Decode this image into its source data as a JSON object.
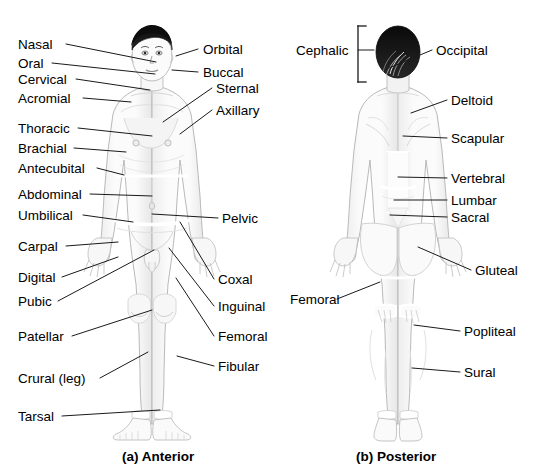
{
  "figure": {
    "type": "anatomical-regions-diagram",
    "background_color": "#ffffff",
    "text_color": "#000000",
    "leader_line_color": "#1a1a1a",
    "body_fill_color": "#fafafa",
    "body_outline_color": "#b8b8b8",
    "hair_color": "#101010"
  },
  "panels": [
    {
      "id": "anterior",
      "caption": "(a) Anterior",
      "caption_x": 122,
      "caption_y": 449
    },
    {
      "id": "posterior",
      "caption": "(b) Posterior",
      "caption_x": 356,
      "caption_y": 449
    }
  ],
  "labels": {
    "anterior_left": [
      {
        "text": "Nasal",
        "x": 18,
        "y": 38,
        "line": [
          66,
          44,
          156,
          62
        ]
      },
      {
        "text": "Oral",
        "x": 18,
        "y": 57,
        "line": [
          52,
          63,
          155,
          74
        ]
      },
      {
        "text": "Cervical",
        "x": 18,
        "y": 73,
        "line": [
          76,
          79,
          150,
          90
        ]
      },
      {
        "text": "Acromial",
        "x": 18,
        "y": 92,
        "line": [
          83,
          98,
          131,
          102
        ]
      },
      {
        "text": "Thoracic",
        "x": 18,
        "y": 122,
        "line": [
          78,
          128,
          152,
          136
        ]
      },
      {
        "text": "Brachial",
        "x": 18,
        "y": 142,
        "line": [
          74,
          148,
          126,
          152
        ]
      },
      {
        "text": "Antecubital",
        "x": 18,
        "y": 162,
        "line": [
          97,
          168,
          124,
          175
        ]
      },
      {
        "text": "Abdominal",
        "x": 18,
        "y": 188,
        "line": [
          90,
          194,
          152,
          196
        ]
      },
      {
        "text": "Umbilical",
        "x": 18,
        "y": 209,
        "line": [
          83,
          215,
          133,
          222
        ]
      },
      {
        "text": "Carpal",
        "x": 18,
        "y": 240,
        "line": [
          66,
          246,
          118,
          242
        ]
      },
      {
        "text": "Digital",
        "x": 18,
        "y": 271,
        "line": [
          62,
          277,
          118,
          257
        ]
      },
      {
        "text": "Pubic",
        "x": 18,
        "y": 295,
        "line": [
          58,
          301,
          154,
          250
        ]
      },
      {
        "text": "Patellar",
        "x": 18,
        "y": 330,
        "line": [
          72,
          336,
          152,
          310
        ]
      },
      {
        "text": "Crural (leg)",
        "x": 18,
        "y": 372,
        "line": [
          100,
          378,
          148,
          352
        ]
      },
      {
        "text": "Tarsal",
        "x": 18,
        "y": 410,
        "line": [
          62,
          416,
          160,
          410
        ]
      }
    ],
    "anterior_right": [
      {
        "text": "Orbital",
        "x": 203,
        "y": 43,
        "line": [
          198,
          49,
          176,
          56
        ]
      },
      {
        "text": "Buccal",
        "x": 203,
        "y": 66,
        "line": [
          198,
          72,
          172,
          70
        ]
      },
      {
        "text": "Sternal",
        "x": 216,
        "y": 82,
        "line": [
          212,
          88,
          163,
          122
        ]
      },
      {
        "text": "Axillary",
        "x": 216,
        "y": 104,
        "line": [
          212,
          110,
          180,
          134
        ]
      },
      {
        "text": "Pelvic",
        "x": 222,
        "y": 212,
        "line": [
          218,
          218,
          152,
          214
        ]
      },
      {
        "text": "Coxal",
        "x": 218,
        "y": 273,
        "line": [
          214,
          279,
          180,
          222
        ]
      },
      {
        "text": "Inguinal",
        "x": 218,
        "y": 300,
        "line": [
          214,
          306,
          169,
          248
        ]
      },
      {
        "text": "Femoral",
        "x": 218,
        "y": 330,
        "line": [
          214,
          336,
          176,
          278
        ]
      },
      {
        "text": "Fibular",
        "x": 218,
        "y": 360,
        "line": [
          214,
          366,
          177,
          356
        ]
      }
    ],
    "posterior_left": [
      {
        "text": "Cephalic",
        "x": 296,
        "y": 44,
        "line": [
          358,
          50,
          374,
          50
        ]
      },
      {
        "text": "Femoral",
        "x": 290,
        "y": 293,
        "line": [
          337,
          299,
          380,
          282
        ]
      }
    ],
    "posterior_right": [
      {
        "text": "Occipital",
        "x": 436,
        "y": 44,
        "line": [
          432,
          50,
          389,
          68
        ]
      },
      {
        "text": "Deltoid",
        "x": 451,
        "y": 94,
        "line": [
          447,
          100,
          411,
          113
        ]
      },
      {
        "text": "Scapular",
        "x": 451,
        "y": 132,
        "line": [
          447,
          138,
          403,
          136
        ]
      },
      {
        "text": "Vertebral",
        "x": 451,
        "y": 172,
        "line": [
          447,
          178,
          398,
          177
        ]
      },
      {
        "text": "Lumbar",
        "x": 451,
        "y": 194,
        "line": [
          447,
          200,
          394,
          200
        ]
      },
      {
        "text": "Sacral",
        "x": 451,
        "y": 211,
        "line": [
          447,
          217,
          390,
          215
        ]
      },
      {
        "text": "Gluteal",
        "x": 475,
        "y": 264,
        "line": [
          471,
          270,
          418,
          247
        ]
      },
      {
        "text": "Popliteal",
        "x": 464,
        "y": 325,
        "line": [
          460,
          331,
          414,
          325
        ]
      },
      {
        "text": "Sural",
        "x": 464,
        "y": 366,
        "line": [
          460,
          372,
          412,
          368
        ]
      }
    ]
  },
  "bracket": {
    "name": "cephalic-bracket",
    "x": 358,
    "y_top": 26,
    "y_bottom": 82,
    "tick": 8
  }
}
